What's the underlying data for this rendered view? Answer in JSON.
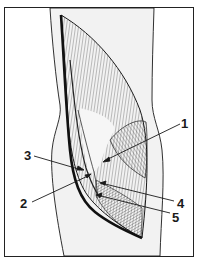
{
  "figure": {
    "type": "anatomical-illustration",
    "colors": {
      "background": "#ffffff",
      "limb_fill": "#f2f2f2",
      "line": "#1a1a1a",
      "border": "#222222"
    },
    "labels": [
      {
        "id": "1",
        "text": "1",
        "x": 181,
        "y": 118,
        "target_x": 103,
        "target_y": 162
      },
      {
        "id": "2",
        "text": "2",
        "x": 20,
        "y": 198,
        "target_x": 90,
        "target_y": 174
      },
      {
        "id": "3",
        "text": "3",
        "x": 24,
        "y": 150,
        "target_x": 83,
        "target_y": 170
      },
      {
        "id": "4",
        "text": "4",
        "x": 177,
        "y": 198,
        "target_x": 100,
        "target_y": 183
      },
      {
        "id": "5",
        "text": "5",
        "x": 172,
        "y": 211,
        "target_x": 97,
        "target_y": 195
      }
    ]
  }
}
